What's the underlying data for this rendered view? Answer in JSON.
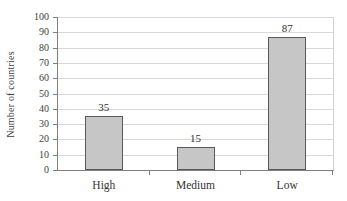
{
  "chart_data": {
    "type": "bar",
    "categories": [
      "High",
      "Medium",
      "Low"
    ],
    "values": [
      35,
      15,
      87
    ],
    "data_labels": [
      "35",
      "15",
      "87"
    ],
    "title": "",
    "xlabel": "",
    "ylabel": "Number of countries",
    "ylim": [
      0,
      100
    ],
    "ytick_step": 10,
    "ytick_labels": [
      "0",
      "10",
      "20",
      "30",
      "40",
      "50",
      "60",
      "70",
      "80",
      "90",
      "100"
    ],
    "grid": true,
    "legend": "none",
    "show_data_labels": true
  },
  "colors": {
    "background": "#ffffff",
    "bar_fill": "#c6c6c6",
    "bar_border": "#595959",
    "gridline": "#d9d9d9",
    "axis_line": "#7f7f7f",
    "text": "#333333"
  }
}
